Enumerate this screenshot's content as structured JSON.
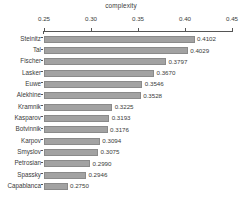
{
  "chart_data": {
    "type": "bar",
    "orientation": "horizontal",
    "title": "complexity",
    "xlabel": "",
    "ylabel": "",
    "xlim": [
      0.25,
      0.45
    ],
    "xticks": [
      "0.25",
      "0.30",
      "0.35",
      "0.40",
      "0.45"
    ],
    "xtick_values": [
      0.25,
      0.3,
      0.35,
      0.4,
      0.45
    ],
    "grid": false,
    "legend": "none",
    "axis_position": "top",
    "bar_color": "#a2a2a2",
    "bar_edge_color": "#8a8a8a",
    "axis_color": "#555555",
    "text_color": "#3a3a3a",
    "background": "#ffffff",
    "categories": [
      "Steinitz",
      "Tal",
      "Fischer",
      "Lasker",
      "Euwe",
      "Alekhine",
      "Kramnik",
      "Kasparov",
      "Botvinnik",
      "Karpov",
      "Smyslov",
      "Petrosian",
      "Spassky",
      "Capablanca"
    ],
    "values": [
      0.4102,
      0.4029,
      0.3797,
      0.367,
      0.3546,
      0.3528,
      0.3225,
      0.3193,
      0.3176,
      0.3094,
      0.3075,
      0.299,
      0.2946,
      0.275
    ],
    "value_labels": [
      "0.4102",
      "0.4029",
      "0.3797",
      "0.3670",
      "0.3546",
      "0.3528",
      "0.3225",
      "0.3193",
      "0.3176",
      "0.3094",
      "0.3075",
      "0.2990",
      "0.2946",
      "0.2750"
    ]
  }
}
